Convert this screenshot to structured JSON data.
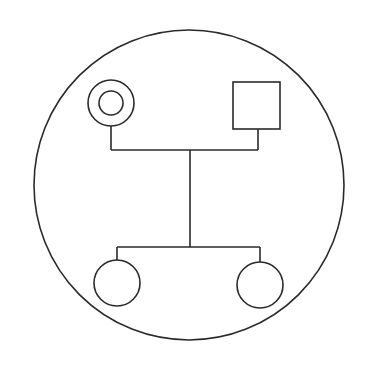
{
  "diagram": {
    "type": "pedigree-chart",
    "stroke_color": "#2a2a2a",
    "background_color": "#ffffff",
    "enclosure": {
      "shape": "circle",
      "cx": 189,
      "cy": 185,
      "r": 155
    },
    "parents": [
      {
        "id": "mother",
        "sex": "female",
        "symbol": "double-circle",
        "cx": 111,
        "cy": 103,
        "r_outer": 23,
        "r_inner": 12
      },
      {
        "id": "father",
        "sex": "male",
        "symbol": "square",
        "x": 233,
        "y": 82,
        "size": 47
      }
    ],
    "mating_line": {
      "y": 150,
      "x1": 111,
      "x2": 258
    },
    "descent_line": {
      "x": 190,
      "y1": 150,
      "y2": 247
    },
    "sibship_line": {
      "y": 247,
      "x1": 117,
      "x2": 260
    },
    "children": [
      {
        "id": "child-1",
        "sex": "female",
        "symbol": "circle",
        "cx": 117,
        "cy": 283,
        "r": 23
      },
      {
        "id": "child-2",
        "sex": "female",
        "symbol": "circle",
        "cx": 260,
        "cy": 285,
        "r": 23
      }
    ]
  }
}
